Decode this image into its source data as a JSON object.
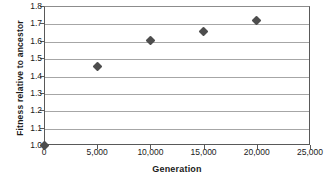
{
  "chart_data": {
    "type": "scatter",
    "title": "",
    "xlabel": "Generation",
    "ylabel": "Fitness relative to ancestor",
    "xlim": [
      0,
      25000
    ],
    "ylim": [
      1.0,
      1.8
    ],
    "grid": true,
    "legend": "none",
    "xticks": [
      "0",
      "5,000",
      "10,000",
      "15,000",
      "20,000",
      "25,000"
    ],
    "xtick_values": [
      0,
      5000,
      10000,
      15000,
      20000,
      25000
    ],
    "yticks": [
      "1.0",
      "1.1",
      "1.2",
      "1.3",
      "1.4",
      "1.5",
      "1.6",
      "1.7",
      "1.8"
    ],
    "ytick_values": [
      1.0,
      1.1,
      1.2,
      1.3,
      1.4,
      1.5,
      1.6,
      1.7,
      1.8
    ],
    "marker": "diamond",
    "marker_color": "#4d4d4d",
    "gridline_color": "#a6a6a6",
    "axis_color": "#595959",
    "x": [
      0,
      5000,
      10000,
      15000,
      20000
    ],
    "y": [
      1.0,
      1.45,
      1.6,
      1.655,
      1.715
    ],
    "points": [
      {
        "x": 0,
        "y": 1.0
      },
      {
        "x": 5000,
        "y": 1.45
      },
      {
        "x": 10000,
        "y": 1.6
      },
      {
        "x": 15000,
        "y": 1.655
      },
      {
        "x": 20000,
        "y": 1.715
      }
    ]
  }
}
